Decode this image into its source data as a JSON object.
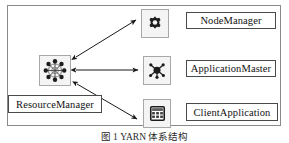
{
  "figure": {
    "caption": "图 1    YARN 体系结构",
    "frame": {
      "border_color": "#8a8a8a",
      "background": "#ffffff"
    },
    "arrow_color": "#1a1a1a"
  },
  "nodes": {
    "resource_manager": {
      "label": "ResourceManager",
      "icon": "cluster-network-icon"
    },
    "node_manager": {
      "label": "NodeManager",
      "icon": "gear-icon"
    },
    "application_master": {
      "label": "ApplicationMaster",
      "icon": "node-hub-icon"
    },
    "client_application": {
      "label": "ClientApplication",
      "icon": "calculator-window-icon"
    }
  },
  "connections": [
    {
      "name": "rm-to-nodemanager",
      "from": "ResourceManager",
      "to": "NodeManager",
      "style": "double-headed-arrow"
    },
    {
      "name": "rm-to-applicationmaster",
      "from": "ResourceManager",
      "to": "ApplicationMaster",
      "style": "double-headed-arrow"
    },
    {
      "name": "rm-to-clientapplication",
      "from": "ResourceManager",
      "to": "ClientApplication",
      "style": "double-headed-arrow"
    }
  ]
}
